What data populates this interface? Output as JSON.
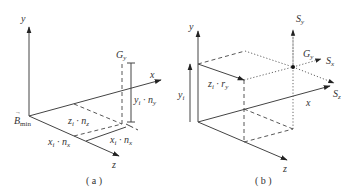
{
  "panels": [
    {
      "id": "a",
      "caption": "( a )",
      "labels": {
        "y_axis": "y",
        "x_axis": "x",
        "z_axis": "z",
        "origin": "B",
        "origin_sub": "min",
        "point": "G",
        "point_sub": "y",
        "height": "y",
        "height_sub": "i",
        "height_rest": " · n",
        "height_rest_sub": "y",
        "depth": "z",
        "depth_sub": "i",
        "depth_rest": " · n",
        "depth_rest_sub": "z",
        "width_left": "x",
        "width_left_sub": "i",
        "width_left_rest": " · n",
        "width_left_rest_sub": "x",
        "width_right": "x",
        "width_right_sub": "i",
        "width_right_rest": " · n",
        "width_right_rest_sub": "x"
      }
    },
    {
      "id": "b",
      "caption": "( b )",
      "labels": {
        "y_axis": "y",
        "x_axis": "x",
        "z_axis": "z",
        "height": "y",
        "height_sub": "i",
        "offset": "z",
        "offset_sub": "i",
        "offset_rest": " · r",
        "offset_rest_sub": "y",
        "point": "G",
        "point_sub": "y",
        "sy": "S",
        "sy_sub": "y",
        "sx": "S",
        "sx_sub": "x",
        "sz": "S",
        "sz_sub": "z"
      }
    }
  ]
}
